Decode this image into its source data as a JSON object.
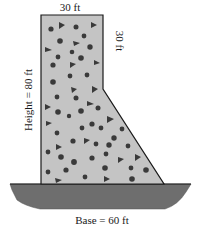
{
  "diagram": {
    "type": "dam cross-section",
    "labels": {
      "top_width": "30 ft",
      "right_vertical": "30 ft",
      "height": "Height = 80 ft",
      "base": "Base = 60 ft"
    },
    "colors": {
      "concrete_fill": "#c4c4c4",
      "outline": "#1a1a1a",
      "stones": "#3a3a3a",
      "ground": "#6e6e6e"
    },
    "dimensions_ft": {
      "top_width": 30,
      "right_vertical_segment": 30,
      "height": 80,
      "base": 60
    }
  }
}
